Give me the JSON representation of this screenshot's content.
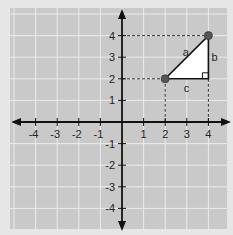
{
  "figure": {
    "type": "coordinate-plane",
    "background_color": "#e6e6e6",
    "panel_color": "#c9c9c9",
    "grid_color": "#ececec",
    "axis_color": "#111111",
    "x_range": [
      -4,
      4
    ],
    "y_range": [
      -4,
      4
    ],
    "x_tick_labels": [
      "-4",
      "-3",
      "-2",
      "-1",
      "1",
      "2",
      "3",
      "4"
    ],
    "y_tick_labels": [
      "4",
      "3",
      "2",
      "1",
      "-1",
      "-2",
      "-3",
      "-4"
    ],
    "points": [
      {
        "x": 2,
        "y": 2,
        "color": "#555555"
      },
      {
        "x": 4,
        "y": 4,
        "color": "#555555"
      }
    ],
    "triangle": {
      "vertices": [
        [
          2,
          2
        ],
        [
          4,
          4
        ],
        [
          4,
          2
        ]
      ],
      "fill": "#ffffff",
      "stroke": "#111111",
      "right_angle_at": [
        4,
        2
      ],
      "side_labels": {
        "a": "a",
        "b": "b",
        "c": "c"
      }
    },
    "dashed_guides": [
      {
        "from": [
          0,
          4
        ],
        "to": [
          4,
          4
        ]
      },
      {
        "from": [
          0,
          2
        ],
        "to": [
          2,
          2
        ]
      },
      {
        "from": [
          2,
          2
        ],
        "to": [
          2,
          0
        ]
      },
      {
        "from": [
          4,
          2
        ],
        "to": [
          4,
          0
        ]
      }
    ]
  }
}
